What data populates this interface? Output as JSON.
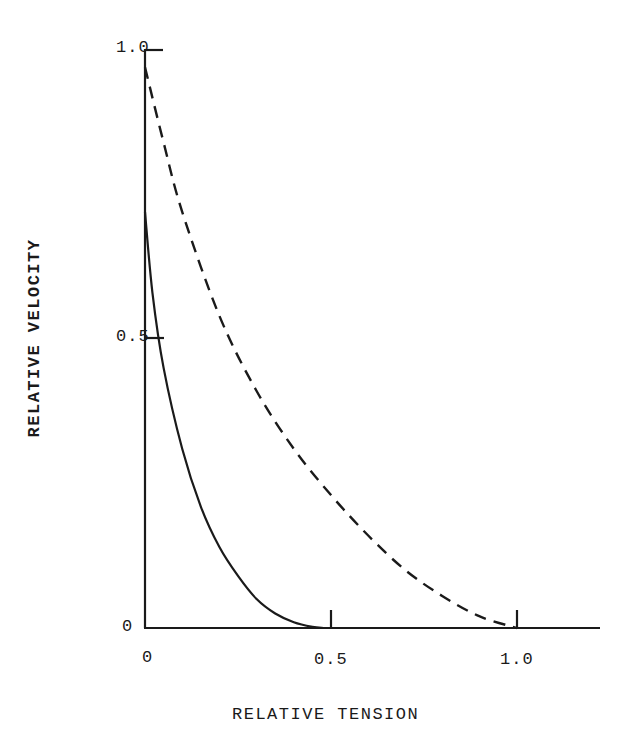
{
  "chart_data": {
    "type": "line",
    "title": "",
    "xlabel": "RELATIVE TENSION",
    "ylabel": "RELATIVE VELOCITY",
    "xlim": [
      0,
      1.2
    ],
    "ylim": [
      0,
      1.0
    ],
    "grid": false,
    "legend": null,
    "x_ticks": [
      "0",
      "0.5",
      "1.0"
    ],
    "y_ticks": [
      "0",
      "0.5",
      "1.0"
    ],
    "series": [
      {
        "name": "solid curve",
        "style": "solid",
        "x": [
          0,
          0.02,
          0.05,
          0.1,
          0.15,
          0.2,
          0.25,
          0.3,
          0.35,
          0.4,
          0.45,
          0.48
        ],
        "y": [
          0.72,
          0.58,
          0.45,
          0.31,
          0.21,
          0.14,
          0.09,
          0.05,
          0.025,
          0.01,
          0.002,
          0
        ]
      },
      {
        "name": "dashed curve",
        "style": "dashed",
        "x": [
          0,
          0.05,
          0.1,
          0.2,
          0.3,
          0.4,
          0.5,
          0.6,
          0.7,
          0.8,
          0.9,
          1.0
        ],
        "y": [
          0.97,
          0.84,
          0.72,
          0.54,
          0.41,
          0.31,
          0.23,
          0.16,
          0.1,
          0.055,
          0.02,
          0
        ]
      }
    ]
  },
  "labels": {
    "y_tick_1": "1.0",
    "y_tick_05": "0.5",
    "y_tick_0": "0",
    "x_tick_0": "0",
    "x_tick_05": "0.5",
    "x_tick_1": "1.0",
    "xlabel": "RELATIVE TENSION",
    "ylabel": "RELATIVE VELOCITY"
  }
}
